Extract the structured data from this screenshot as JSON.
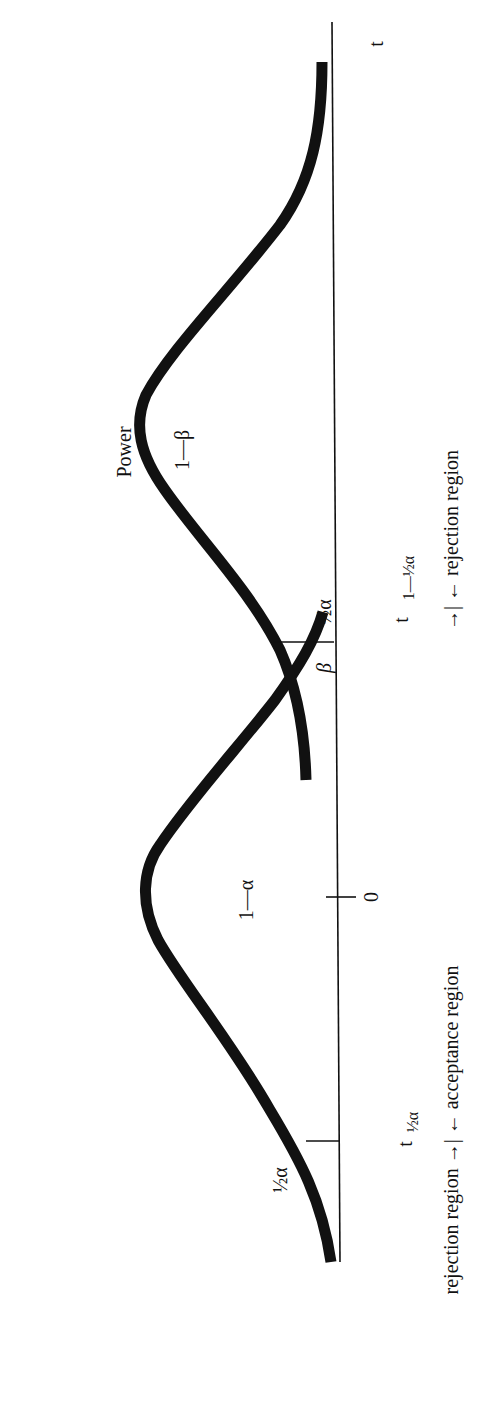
{
  "figure": {
    "orientation": "rotated 90 degrees counter-clockwise",
    "axis_label": "t",
    "zero_tick_label": "0",
    "curves": [
      {
        "name": "null-distribution",
        "region_label": "1—α"
      },
      {
        "name": "alternative-distribution",
        "region_label_top": "Power",
        "region_label_bottom": "1—β"
      }
    ],
    "tail_labels": {
      "left_tail": "½α",
      "right_tail": "½α",
      "beta": "β"
    },
    "critical_values": {
      "lower": {
        "base": "t",
        "subscript": "½α"
      },
      "upper": {
        "base": "t",
        "subscript": "1—½α"
      }
    },
    "region_captions": {
      "left": "rejection region →| ← acceptance region",
      "right": "→| ← rejection region"
    },
    "colors": {
      "ink": "#111111",
      "background": "#ffffff"
    }
  }
}
